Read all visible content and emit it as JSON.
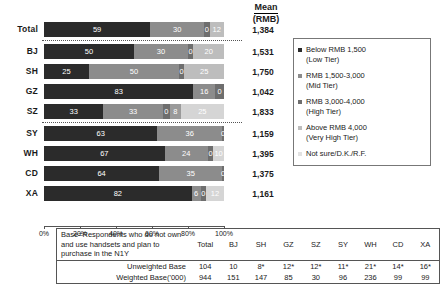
{
  "header": {
    "mean_line1": "Mean",
    "mean_line2": "(RMB)"
  },
  "colors": {
    "low_tier": "#2b2b2b",
    "mid_tier": "#8c8c8c",
    "high_tier": "#6e6e6e",
    "very_high_tier": "#bdbdbd",
    "not_sure": "#e2e2e2"
  },
  "legend": {
    "items": [
      {
        "label": "Below RMB 1,500\n(Low Tier)",
        "color": "#2b2b2b"
      },
      {
        "label": "RMB 1,500-3,000\n(Mid Tier)",
        "color": "#8c8c8c"
      },
      {
        "label": "RMB 3,000-4,000\n(High Tier)",
        "color": "#6e6e6e"
      },
      {
        "label": "Above RMB 4,000\n(Very High Tier)",
        "color": "#bdbdbd"
      },
      {
        "label": "Not sure/D.K./R.F.",
        "color": "#e2e2e2"
      }
    ]
  },
  "xaxis": {
    "ticks": [
      "0%",
      "20%",
      "40%",
      "60%",
      "80%",
      "100%"
    ]
  },
  "chart_data": {
    "type": "bar",
    "title": "",
    "xlabel": "",
    "ylabel": "",
    "xlim": [
      0,
      100
    ],
    "orientation": "horizontal",
    "stacked": true,
    "grid": false,
    "legend_position": "right",
    "categories": [
      "Total",
      "BJ",
      "SH",
      "GZ",
      "SZ",
      "SY",
      "WH",
      "CD",
      "XA"
    ],
    "series": [
      {
        "name": "Below RMB 1,500 (Low Tier)",
        "values": [
          59,
          50,
          25,
          83,
          33,
          63,
          67,
          64,
          82
        ]
      },
      {
        "name": "RMB 1,500-3,000 (Mid Tier)",
        "values": [
          30,
          30,
          50,
          16,
          33,
          36,
          24,
          35,
          6
        ]
      },
      {
        "name": "RMB 3,000-4,000 (High Tier)",
        "values": [
          0,
          0,
          0,
          0,
          0,
          0,
          0,
          0,
          0
        ]
      },
      {
        "name": "Above RMB 4,000 (Very High Tier)",
        "values": [
          12,
          20,
          25,
          1,
          8,
          1,
          10,
          1,
          12
        ]
      },
      {
        "name": "Not sure/D.K./R.F.",
        "values": [
          0,
          0,
          0,
          0,
          25,
          0,
          0,
          0,
          0
        ]
      }
    ],
    "mean_rmb": [
      "1,384",
      "1,531",
      "1,750",
      "1,042",
      "1,833",
      "1,159",
      "1,395",
      "1,375",
      "1,161"
    ],
    "mean_label": "Mean (RMB)"
  },
  "rows": [
    {
      "label": "Total",
      "segments": [
        {
          "v": 59,
          "t": "59",
          "c": "#2b2b2b",
          "fg": "#ffffff"
        },
        {
          "v": 30,
          "t": "30",
          "c": "#8c8c8c",
          "fg": "#ffffff"
        },
        {
          "v": 3,
          "t": "0",
          "c": "#6e6e6e",
          "fg": "#ffffff"
        },
        {
          "v": 8,
          "t": "12",
          "c": "#bdbdbd",
          "fg": "#ffffff"
        }
      ],
      "mean": "1,384"
    },
    {
      "label": "BJ",
      "segments": [
        {
          "v": 50,
          "t": "50",
          "c": "#2b2b2b",
          "fg": "#ffffff"
        },
        {
          "v": 30,
          "t": "30",
          "c": "#8c8c8c",
          "fg": "#ffffff"
        },
        {
          "v": 3,
          "t": "0",
          "c": "#6e6e6e",
          "fg": "#ffffff"
        },
        {
          "v": 17,
          "t": "20",
          "c": "#bdbdbd",
          "fg": "#ffffff"
        }
      ],
      "mean": "1,531"
    },
    {
      "label": "SH",
      "segments": [
        {
          "v": 25,
          "t": "25",
          "c": "#2b2b2b",
          "fg": "#ffffff"
        },
        {
          "v": 50,
          "t": "50",
          "c": "#8c8c8c",
          "fg": "#ffffff"
        },
        {
          "v": 3,
          "t": "0",
          "c": "#6e6e6e",
          "fg": "#ffffff"
        },
        {
          "v": 22,
          "t": "25",
          "c": "#bdbdbd",
          "fg": "#ffffff"
        }
      ],
      "mean": "1,750"
    },
    {
      "label": "GZ",
      "segments": [
        {
          "v": 83,
          "t": "83",
          "c": "#2b2b2b",
          "fg": "#ffffff"
        },
        {
          "v": 12,
          "t": "16",
          "c": "#8c8c8c",
          "fg": "#ffffff"
        },
        {
          "v": 5,
          "t": "0",
          "c": "#6e6e6e",
          "fg": "#ffffff"
        }
      ],
      "mean": "1,042"
    },
    {
      "label": "SZ",
      "segments": [
        {
          "v": 33,
          "t": "33",
          "c": "#2b2b2b",
          "fg": "#ffffff"
        },
        {
          "v": 33,
          "t": "33",
          "c": "#8c8c8c",
          "fg": "#ffffff"
        },
        {
          "v": 4,
          "t": "0",
          "c": "#6e6e6e",
          "fg": "#ffffff"
        },
        {
          "v": 6,
          "t": "8",
          "c": "#9a9a9a",
          "fg": "#ffffff"
        },
        {
          "v": 24,
          "t": "25",
          "c": "#d5d5d5",
          "fg": "#ffffff"
        }
      ],
      "mean": "1,833"
    },
    {
      "label": "SY",
      "segments": [
        {
          "v": 63,
          "t": "63",
          "c": "#2b2b2b",
          "fg": "#ffffff"
        },
        {
          "v": 36,
          "t": "36",
          "c": "#8c8c8c",
          "fg": "#ffffff"
        },
        {
          "v": 1,
          "t": "0",
          "c": "#6e6e6e",
          "fg": "#ffffff"
        }
      ],
      "mean": "1,159"
    },
    {
      "label": "WH",
      "segments": [
        {
          "v": 67,
          "t": "67",
          "c": "#2b2b2b",
          "fg": "#ffffff"
        },
        {
          "v": 24,
          "t": "24",
          "c": "#8c8c8c",
          "fg": "#ffffff"
        },
        {
          "v": 3,
          "t": "0",
          "c": "#6e6e6e",
          "fg": "#ffffff"
        },
        {
          "v": 6,
          "t": "10",
          "c": "#d5d5d5",
          "fg": "#ffffff"
        }
      ],
      "mean": "1,395"
    },
    {
      "label": "CD",
      "segments": [
        {
          "v": 64,
          "t": "64",
          "c": "#2b2b2b",
          "fg": "#ffffff"
        },
        {
          "v": 35,
          "t": "35",
          "c": "#8c8c8c",
          "fg": "#ffffff"
        },
        {
          "v": 1,
          "t": "0",
          "c": "#6e6e6e",
          "fg": "#ffffff"
        }
      ],
      "mean": "1,375"
    },
    {
      "label": "XA",
      "segments": [
        {
          "v": 82,
          "t": "82",
          "c": "#2b2b2b",
          "fg": "#ffffff"
        },
        {
          "v": 5,
          "t": "6",
          "c": "#8c8c8c",
          "fg": "#ffffff"
        },
        {
          "v": 3,
          "t": "0",
          "c": "#6e6e6e",
          "fg": "#ffffff"
        },
        {
          "v": 10,
          "t": "12",
          "c": "#d5d5d5",
          "fg": "#ffffff"
        }
      ],
      "mean": "1,161"
    }
  ],
  "base_table": {
    "description": "Base=Respondents who do not own and use handsets and plan to purchase in the N1Y",
    "columns": [
      "Total",
      "BJ",
      "SH",
      "GZ",
      "SZ",
      "SY",
      "WH",
      "CD",
      "XA"
    ],
    "rows": [
      {
        "label": "Unweighted Base",
        "values": [
          "104",
          "10",
          "8*",
          "12*",
          "12*",
          "11*",
          "21*",
          "14*",
          "16*"
        ]
      },
      {
        "label": "Weighted Base('000)",
        "values": [
          "944",
          "151",
          "147",
          "85",
          "30",
          "96",
          "236",
          "99",
          "99"
        ]
      }
    ]
  }
}
